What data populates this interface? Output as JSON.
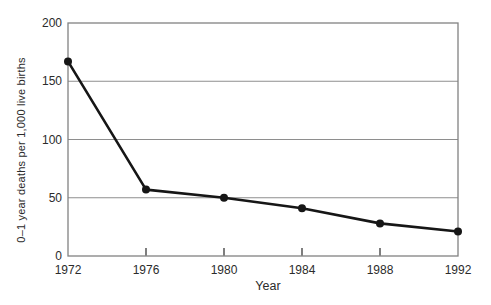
{
  "chart_data": {
    "type": "line",
    "title": "",
    "xlabel": "Year",
    "ylabel": "0–1 year deaths per 1,000 live births",
    "x": [
      1972,
      1976,
      1980,
      1984,
      1988,
      1992
    ],
    "values": [
      167,
      57,
      50,
      41,
      28,
      21
    ],
    "series": [
      {
        "name": "0–1 year deaths per 1,000 live births",
        "values": [
          167,
          57,
          50,
          41,
          28,
          21
        ]
      }
    ],
    "xlim": [
      1972,
      1992
    ],
    "ylim": [
      0,
      200
    ],
    "x_ticks": [
      1972,
      1976,
      1980,
      1984,
      1988,
      1992
    ],
    "y_ticks": [
      0,
      50,
      100,
      150,
      200
    ],
    "grid": "horizontal-only",
    "legend": "none",
    "marker": "filled-circle",
    "line_color": "#161616",
    "axis_color": "#828282",
    "grid_color": "#8e8e8e",
    "tick_color": "#3a3a3a",
    "text_color": "#2b2b2b",
    "background_color": "#ffffff"
  }
}
